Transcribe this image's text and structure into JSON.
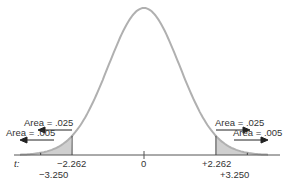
{
  "chart_data": {
    "type": "area",
    "xlabel": "t:",
    "ylabel": "",
    "x_ticks": [
      {
        "value": -3.25,
        "label": "−3.250"
      },
      {
        "value": -2.262,
        "label": "−2.262"
      },
      {
        "value": 0,
        "label": "0"
      },
      {
        "value": 2.262,
        "label": "+2.262"
      },
      {
        "value": 3.25,
        "label": "+3.250"
      }
    ],
    "shaded_regions": [
      {
        "from": "-inf",
        "to": -2.262,
        "area": 0.025,
        "label": "Area = .025",
        "side": "left"
      },
      {
        "from": "-inf",
        "to": -3.25,
        "area": 0.005,
        "label": "Area = .005",
        "side": "left"
      },
      {
        "from": 2.262,
        "to": "inf",
        "area": 0.025,
        "label": "Area = .025",
        "side": "right"
      },
      {
        "from": 3.25,
        "to": "inf",
        "area": 0.005,
        "label": "Area = .005",
        "side": "right"
      }
    ],
    "grid": false,
    "colors": {
      "curve": "#b0b0b0",
      "shade_dark": "#cfcfcf",
      "shade_light": "#e6e6e6",
      "axis": "#555555"
    }
  },
  "labels": {
    "axis_var": "t:",
    "tick_neg_2262": "−2.262",
    "tick_neg_3250": "−3.250",
    "tick_zero": "0",
    "tick_pos_2262": "+2.262",
    "tick_pos_3250": "+3.250",
    "left_025": "Area = .025",
    "left_005": "Area = .005",
    "right_025": "Area = .025",
    "right_005": "Area = .005"
  }
}
